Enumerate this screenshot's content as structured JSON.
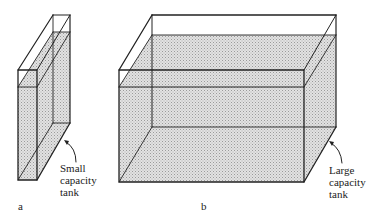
{
  "figure": {
    "panels": [
      {
        "id": "a",
        "caption": "a",
        "label_lines": [
          "Small",
          "capacity",
          "tank"
        ],
        "label": "Small capacity tank"
      },
      {
        "id": "b",
        "caption": "b",
        "label_lines": [
          "Large",
          "capacity",
          "tank"
        ],
        "label": "Large capacity tank"
      }
    ],
    "colors": {
      "line": "#222222",
      "water": "#d4d4d4",
      "background": "#ffffff"
    }
  }
}
